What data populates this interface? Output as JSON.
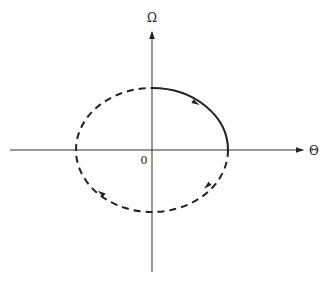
{
  "diagram": {
    "type": "phase-portrait",
    "axes": {
      "x_label": "Θ",
      "y_label": "Ω",
      "origin_label": "0"
    },
    "colors": {
      "stroke": "#222222",
      "axis": "#333333",
      "background": "#ffffff"
    },
    "orbit": {
      "shape": "ellipse",
      "solid_segment": "first quadrant (top-right)",
      "dashed_segment": "remaining three quadrants",
      "direction": "clockwise"
    }
  }
}
